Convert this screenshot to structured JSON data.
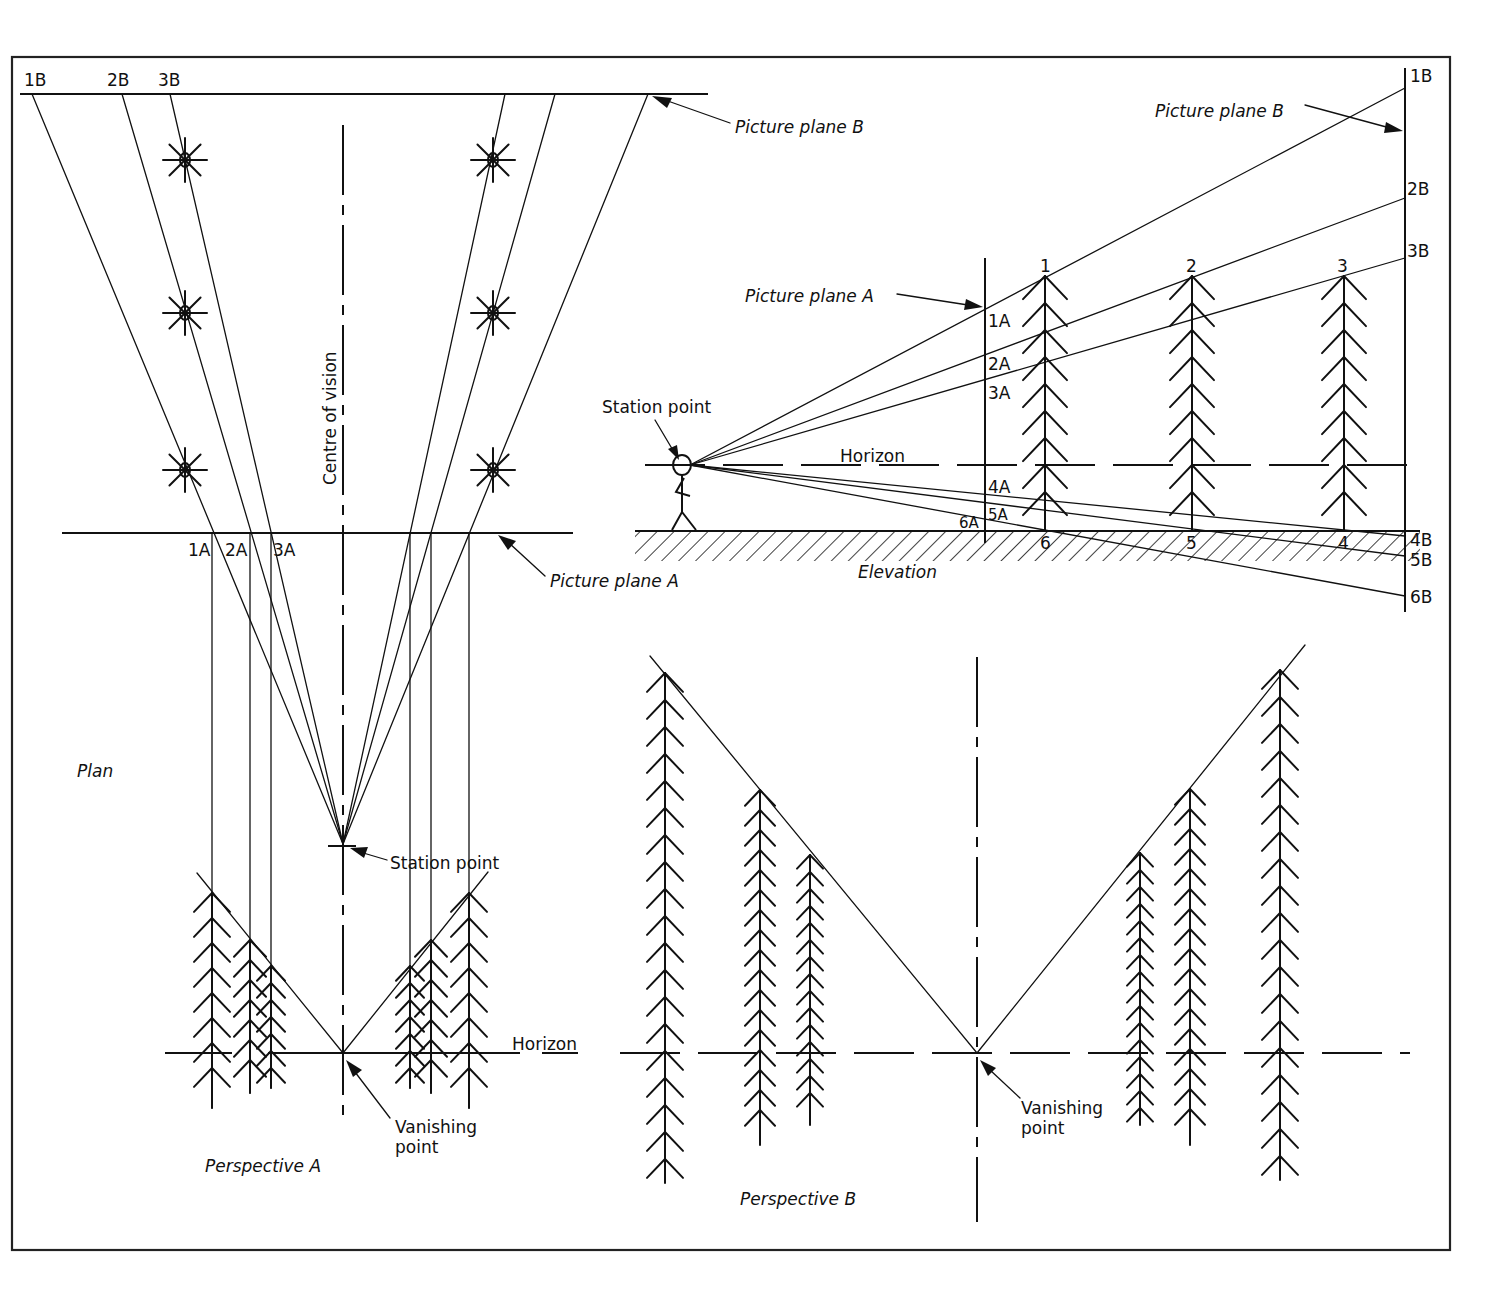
{
  "diagram": {
    "frame": {
      "x": 12,
      "y": 57,
      "w": 1438,
      "h": 1193
    },
    "plan": {
      "caption": "Plan",
      "centre_of_vision_label": "Centre of vision",
      "station_point_label": "Station point",
      "picture_plane_a_label": "Picture plane A",
      "picture_plane_b_label": "Picture plane B",
      "pp_b_points": [
        {
          "label": "1B",
          "x": 32
        },
        {
          "label": "2B",
          "x": 122
        },
        {
          "label": "3B",
          "x": 170
        }
      ],
      "pp_a_points": [
        {
          "label": "1A",
          "x": 212
        },
        {
          "label": "2A",
          "x": 250
        },
        {
          "label": "3A",
          "x": 271
        }
      ],
      "right_pp_b_x": [
        505,
        555,
        648
      ],
      "right_pp_a_x": [
        410,
        431,
        469
      ],
      "station_point": {
        "x": 343,
        "y": 844
      },
      "trees_left_x": 185,
      "trees_right_x": 493,
      "trees_y": [
        160,
        313,
        470
      ]
    },
    "elevation": {
      "caption": "Elevation",
      "horizon_label": "Horizon",
      "station_point_label": "Station point",
      "picture_plane_a_label": "Picture plane A",
      "picture_plane_b_label": "Picture plane B",
      "tree_labels_top": [
        "1",
        "2",
        "3"
      ],
      "tree_labels_bottom": [
        "6",
        "5",
        "4"
      ],
      "pp_a_labels": [
        "1A",
        "2A",
        "3A",
        "4A",
        "5A",
        "6A"
      ],
      "pp_b_labels": [
        "1B",
        "2B",
        "3B",
        "4B",
        "5B",
        "6B"
      ]
    },
    "perspective_a": {
      "caption": "Perspective A",
      "horizon_label": "Horizon",
      "vanishing_point_label_line1": "Vanishing",
      "vanishing_point_label_line2": "point"
    },
    "perspective_b": {
      "caption": "Perspective B",
      "vanishing_point_label_line1": "Vanishing",
      "vanishing_point_label_line2": "point"
    }
  }
}
